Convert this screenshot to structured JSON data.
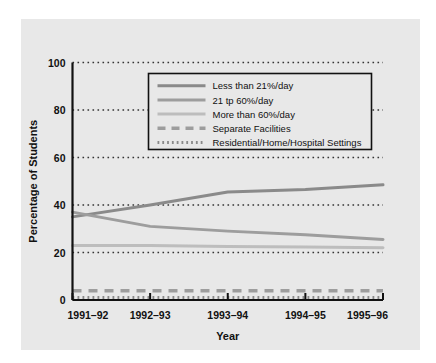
{
  "figure": {
    "background_color": "#ffffff",
    "panel_color": "#e8e8e8",
    "plot_background_color": "#e8e8e8"
  },
  "chart_data": {
    "type": "line",
    "title": "",
    "xlabel": "Year",
    "ylabel": "Percentage of Students",
    "categories": [
      "1991–92",
      "1992–93",
      "1993–94",
      "1994–95",
      "1995–96"
    ],
    "x_tick_labels": [
      "1991–92",
      "1992–93",
      "1993–94",
      "1994–95",
      "1995–96"
    ],
    "y_tick_labels": [
      "0",
      "20",
      "40",
      "60",
      "80",
      "100"
    ],
    "y_ticks": [
      0,
      20,
      40,
      60,
      80,
      100
    ],
    "ylim": [
      0,
      100
    ],
    "grid": "horizontal-dotted",
    "legend_position": "upper-center-inside",
    "series": [
      {
        "name": "Less than 21%/day",
        "values": [
          35,
          40,
          45.5,
          46.5,
          48.5
        ],
        "color": "#8a8a8a",
        "style": "solid",
        "width": 3
      },
      {
        "name": "21 tp 60%/day",
        "values": [
          37,
          31,
          29,
          27.5,
          25.5
        ],
        "color": "#9d9d9d",
        "style": "solid",
        "width": 3
      },
      {
        "name": "More than 60%/day",
        "values": [
          23,
          23,
          22.5,
          22.3,
          22
        ],
        "color": "#bdbdbd",
        "style": "solid",
        "width": 3
      },
      {
        "name": "Separate Facilities",
        "values": [
          3.9,
          3.9,
          3.9,
          3.9,
          3.9
        ],
        "color": "#9d9d9d",
        "style": "dashed",
        "width": 3.5
      },
      {
        "name": "Residential/Home/Hospital Settings",
        "values": [
          1.1,
          1.1,
          1.1,
          1.1,
          1.1
        ],
        "color": "#8a8a8a",
        "style": "dotted",
        "width": 3
      }
    ]
  }
}
